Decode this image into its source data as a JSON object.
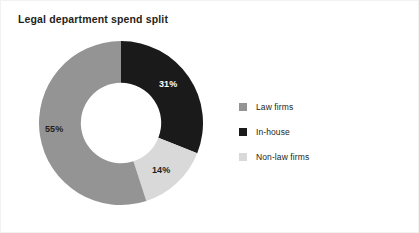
{
  "chart_data": {
    "type": "pie",
    "variant": "donut",
    "title": "Legal department spend split",
    "xlabel": "",
    "ylabel": "",
    "grid": false,
    "legend_position": "right",
    "start_angle_deg": 0,
    "direction": "clockwise",
    "hole_ratio": 0.49,
    "categories": [
      "In-house",
      "Non-law firms",
      "Law firms"
    ],
    "values": [
      31,
      14,
      55
    ],
    "units": "%",
    "data_labels": [
      "31%",
      "14%",
      "55%"
    ],
    "colors": [
      "#1a1a1a",
      "#d9d9d9",
      "#949494"
    ],
    "label_text_colors": [
      "#ffffff",
      "#231f20",
      "#231f20"
    ],
    "slices": [
      {
        "name": "In-house",
        "value": 31,
        "label": "31%",
        "color": "#1a1a1a",
        "label_color": "#ffffff"
      },
      {
        "name": "Non-law firms",
        "value": 14,
        "label": "14%",
        "color": "#d9d9d9",
        "label_color": "#231f20"
      },
      {
        "name": "Law firms",
        "value": 55,
        "label": "55%",
        "color": "#949494",
        "label_color": "#231f20"
      }
    ],
    "legend": [
      {
        "label": "Law firms",
        "color": "#949494"
      },
      {
        "label": "In-house",
        "color": "#1a1a1a"
      },
      {
        "label": "Non-law firms",
        "color": "#d9d9d9"
      }
    ]
  },
  "figure": {
    "background": "#ffffff",
    "border_color": "#f2f2f2",
    "title_color": "#231f20"
  }
}
